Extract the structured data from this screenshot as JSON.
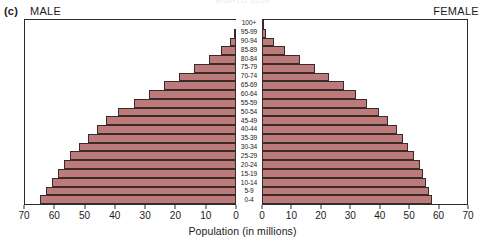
{
  "figure": {
    "panel_letter": "(c)",
    "male_header": "MALE",
    "female_header": "FEMALE",
    "cropped_top_text": "WORLD 2050"
  },
  "chart_data": {
    "type": "bar",
    "subtype": "population-pyramid",
    "title": "",
    "xlabel": "Population (in millions)",
    "ylabel": "",
    "orientation": "horizontal",
    "grid": false,
    "legend": "none",
    "left_axis": {
      "name": "MALE",
      "ticks": [
        70,
        60,
        50,
        40,
        30,
        20,
        10,
        0
      ],
      "range": [
        70,
        0
      ],
      "direction": "descending"
    },
    "right_axis": {
      "name": "FEMALE",
      "ticks": [
        0,
        10,
        20,
        30,
        40,
        50,
        60,
        70
      ],
      "range": [
        0,
        70
      ],
      "direction": "ascending"
    },
    "categories": [
      "100+",
      "95-99",
      "90-94",
      "85-89",
      "80-84",
      "75-79",
      "70-74",
      "65-69",
      "60-64",
      "55-59",
      "50-54",
      "45-49",
      "40-44",
      "35-39",
      "30-34",
      "25-29",
      "20-24",
      "15-19",
      "10-14",
      "5-9",
      "0-4"
    ],
    "series": [
      {
        "name": "MALE",
        "side": "left",
        "units": "millions",
        "values": [
          0,
          0.5,
          2,
          5,
          9,
          14,
          19,
          24,
          29,
          34,
          39,
          43,
          46,
          49,
          52,
          55,
          57,
          59,
          61,
          63,
          65
        ]
      },
      {
        "name": "FEMALE",
        "side": "right",
        "units": "millions",
        "values": [
          0.5,
          1.5,
          4,
          8,
          13,
          18,
          23,
          28,
          32,
          36,
          40,
          43,
          46,
          48,
          50,
          52,
          54,
          55,
          56,
          57,
          58
        ]
      }
    ],
    "colors": {
      "bar_fill": "#bd7a7a",
      "bar_stroke": "#3a2b2b",
      "axis": "#2b2b2b",
      "background": "#ffffff"
    }
  }
}
